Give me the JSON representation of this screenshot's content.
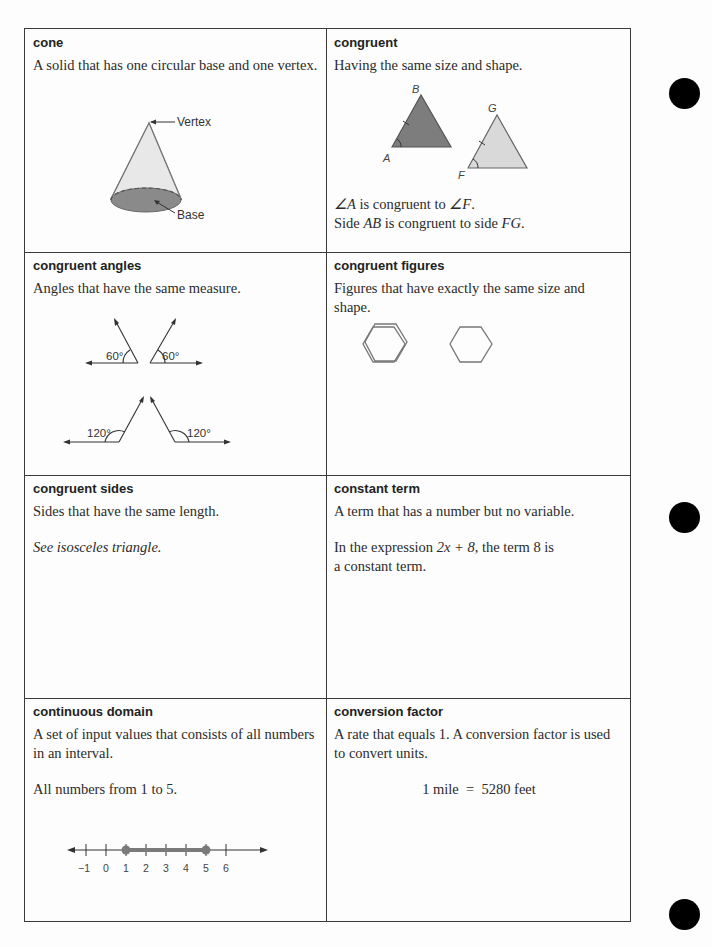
{
  "cells": [
    {
      "term": "cone",
      "definition": "A solid that has one circular base and one vertex.",
      "figure": {
        "labels": {
          "vertex": "Vertex",
          "base": "Base"
        }
      }
    },
    {
      "term": "congruent",
      "definition": "Having the same size and shape.",
      "figure": {
        "labels": {
          "a": "A",
          "b": "B",
          "f": "F",
          "g": "G"
        }
      },
      "example_lines": [
        {
          "pre": "∠A",
          "mid": " is congruent to ",
          "post": "∠F",
          "end": "."
        },
        {
          "pre": "Side ",
          "mid": "AB",
          "post": " is congruent to side ",
          "end": "FG",
          "tail": "."
        }
      ]
    },
    {
      "term": "congruent angles",
      "definition": "Angles that have the same measure.",
      "figure": {
        "angles": [
          "60°",
          "60°",
          "120°",
          "120°"
        ]
      }
    },
    {
      "term": "congruent figures",
      "definition": "Figures that have exactly the same size and shape.",
      "figure": {
        "shapes": [
          "hexagon",
          "hexagon"
        ]
      }
    },
    {
      "term": "congruent sides",
      "definition": "Sides that have the same length.",
      "example": "See isosceles triangle."
    },
    {
      "term": "constant term",
      "definition": "A term that has a number but no variable.",
      "example": {
        "pre": "In the expression ",
        "expr": "2x + 8",
        "post": ", the term 8 is a constant term."
      }
    },
    {
      "term": "continuous domain",
      "definition": "A set of input values that consists of all numbers in an interval.",
      "example": "All numbers from 1 to 5.",
      "figure": {
        "number_line_ticks": [
          "−1",
          "0",
          "1",
          "2",
          "3",
          "4",
          "5",
          "6"
        ],
        "interval": [
          1,
          5
        ]
      }
    },
    {
      "term": "conversion factor",
      "definition": "A rate that equals 1. A conversion factor is used to convert units.",
      "example": "1 mile  =  5280 feet"
    }
  ],
  "colors": {
    "dark_fill": "#7d7d7d",
    "light_fill": "#d9d9d9",
    "line": "#555555",
    "interval": "#7a7a7a"
  }
}
